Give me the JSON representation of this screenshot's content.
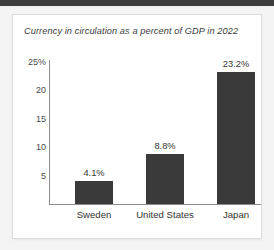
{
  "chart_data": {
    "type": "bar",
    "title": "Currency in circulation as a percent of GDP in 2022",
    "categories": [
      "Sweden",
      "United States",
      "Japan"
    ],
    "values": [
      4.1,
      8.8,
      23.2
    ],
    "value_labels": [
      "4.1%",
      "8.8%",
      "23.2%"
    ],
    "xlabel": "",
    "ylabel": "",
    "ylim": [
      0,
      25
    ],
    "yticks": [
      5,
      10,
      15,
      20,
      25
    ],
    "ytick_labels": [
      "5",
      "10",
      "15",
      "20",
      "25%"
    ],
    "grid": false,
    "legend": false,
    "bar_color": "#3a3a3a",
    "axis_color": "#8d8d8d",
    "text_color": "#333333",
    "background": "#ffffff"
  },
  "card": {
    "title": "Currency in circulation as a percent of GDP in 2022"
  }
}
